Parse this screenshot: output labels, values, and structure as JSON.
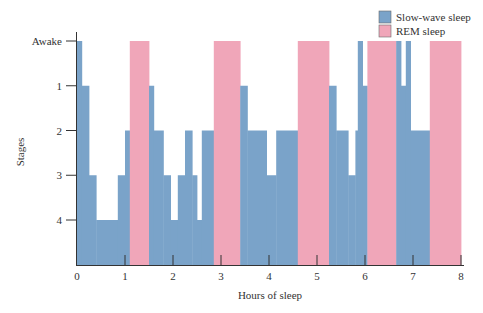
{
  "chart_data": {
    "type": "area",
    "title": "",
    "xlabel": "Hours of sleep",
    "ylabel": "Stages",
    "xlim": [
      0,
      8
    ],
    "x_ticks": [
      0,
      1,
      2,
      3,
      4,
      5,
      6,
      7,
      8
    ],
    "y_ticks": [
      {
        "level": 0,
        "label": "Awake"
      },
      {
        "level": 1,
        "label": "1"
      },
      {
        "level": 2,
        "label": "2"
      },
      {
        "level": 3,
        "label": "3"
      },
      {
        "level": 4,
        "label": "4"
      }
    ],
    "grid": false,
    "legend_position": "top-right",
    "legend": [
      {
        "name": "Slow-wave sleep",
        "key": "sws",
        "color": "#7aa3c9"
      },
      {
        "name": "REM sleep",
        "key": "rem",
        "color": "#f0a6b9"
      }
    ],
    "segments": [
      {
        "start": 0.0,
        "end": 0.1,
        "stage": 0,
        "type": "sws"
      },
      {
        "start": 0.1,
        "end": 0.25,
        "stage": 1,
        "type": "sws"
      },
      {
        "start": 0.25,
        "end": 0.4,
        "stage": 3,
        "type": "sws"
      },
      {
        "start": 0.4,
        "end": 0.85,
        "stage": 4,
        "type": "sws"
      },
      {
        "start": 0.85,
        "end": 1.0,
        "stage": 3,
        "type": "sws"
      },
      {
        "start": 1.0,
        "end": 1.1,
        "stage": 2,
        "type": "sws"
      },
      {
        "start": 1.1,
        "end": 1.5,
        "stage": 0,
        "type": "rem"
      },
      {
        "start": 1.5,
        "end": 1.6,
        "stage": 1,
        "type": "sws"
      },
      {
        "start": 1.6,
        "end": 1.8,
        "stage": 2,
        "type": "sws"
      },
      {
        "start": 1.8,
        "end": 1.95,
        "stage": 3,
        "type": "sws"
      },
      {
        "start": 1.95,
        "end": 2.1,
        "stage": 4,
        "type": "sws"
      },
      {
        "start": 2.1,
        "end": 2.25,
        "stage": 3,
        "type": "sws"
      },
      {
        "start": 2.25,
        "end": 2.4,
        "stage": 2,
        "type": "sws"
      },
      {
        "start": 2.4,
        "end": 2.5,
        "stage": 3,
        "type": "sws"
      },
      {
        "start": 2.5,
        "end": 2.6,
        "stage": 4,
        "type": "sws"
      },
      {
        "start": 2.6,
        "end": 2.85,
        "stage": 2,
        "type": "sws"
      },
      {
        "start": 2.85,
        "end": 3.4,
        "stage": 0,
        "type": "rem"
      },
      {
        "start": 3.4,
        "end": 3.55,
        "stage": 1,
        "type": "sws"
      },
      {
        "start": 3.55,
        "end": 3.95,
        "stage": 2,
        "type": "sws"
      },
      {
        "start": 3.95,
        "end": 4.15,
        "stage": 3,
        "type": "sws"
      },
      {
        "start": 4.15,
        "end": 4.6,
        "stage": 2,
        "type": "sws"
      },
      {
        "start": 4.6,
        "end": 5.25,
        "stage": 0,
        "type": "rem"
      },
      {
        "start": 5.25,
        "end": 5.4,
        "stage": 1,
        "type": "sws"
      },
      {
        "start": 5.4,
        "end": 5.65,
        "stage": 2,
        "type": "sws"
      },
      {
        "start": 5.65,
        "end": 5.8,
        "stage": 3,
        "type": "sws"
      },
      {
        "start": 5.8,
        "end": 5.85,
        "stage": 2,
        "type": "sws"
      },
      {
        "start": 5.85,
        "end": 5.95,
        "stage": 0,
        "type": "sws"
      },
      {
        "start": 5.95,
        "end": 6.05,
        "stage": 1,
        "type": "sws"
      },
      {
        "start": 6.05,
        "end": 6.65,
        "stage": 0,
        "type": "rem"
      },
      {
        "start": 6.65,
        "end": 6.75,
        "stage": 0,
        "type": "sws"
      },
      {
        "start": 6.75,
        "end": 6.85,
        "stage": 1,
        "type": "sws"
      },
      {
        "start": 6.85,
        "end": 6.95,
        "stage": 0,
        "type": "sws"
      },
      {
        "start": 6.95,
        "end": 7.35,
        "stage": 2,
        "type": "sws"
      },
      {
        "start": 7.35,
        "end": 8.0,
        "stage": 0,
        "type": "rem"
      }
    ]
  },
  "colors": {
    "sws": "#7aa3c9",
    "rem": "#f0a6b9",
    "axis": "#333333"
  },
  "labels": {
    "xlabel": "Hours of sleep",
    "ylabel": "Stages",
    "legend_sws": "Slow-wave sleep",
    "legend_rem": "REM sleep"
  }
}
